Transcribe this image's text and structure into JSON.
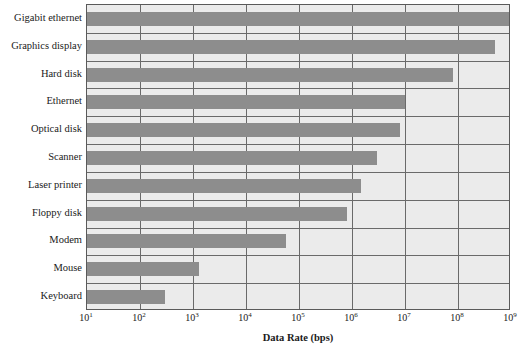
{
  "chart_data": {
    "type": "bar",
    "orientation": "horizontal",
    "title": "",
    "xlabel": "Data Rate (bps)",
    "ylabel": "",
    "xscale": "log",
    "xlim": [
      10,
      1000000000
    ],
    "grid": true,
    "legend": null,
    "categories": [
      "Gigabit ethernet",
      "Graphics display",
      "Hard disk",
      "Ethernet",
      "Optical disk",
      "Scanner",
      "Laser printer",
      "Floppy disk",
      "Modem",
      "Mouse",
      "Keyboard"
    ],
    "values": [
      1000000000,
      500000000,
      80000000,
      10000000,
      8000000,
      3000000,
      1500000,
      800000,
      56000,
      1300,
      300
    ],
    "tick_labels": [
      "10",
      "10",
      "10",
      "10",
      "10",
      "10",
      "10",
      "10",
      "10"
    ],
    "tick_exponents": [
      "1",
      "2",
      "3",
      "4",
      "5",
      "6",
      "7",
      "8",
      "9"
    ],
    "colors": {
      "bar": "#8d8d8d",
      "plot_background": "#ebebeb",
      "gridline": "#6a6a6a",
      "axis_border": "#5a5a5a",
      "text": "#1a1a1a",
      "page_background": "#ffffff"
    }
  }
}
